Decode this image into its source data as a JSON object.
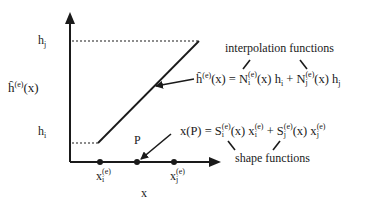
{
  "diagram": {
    "y_axis_label": "ĥ",
    "y_axis_label_sup": "(e)",
    "y_axis_label_arg": "(x)",
    "x_axis_label": "x",
    "hj_label": "h",
    "hj_sub": "j",
    "hi_label": "h",
    "hi_sub": "i",
    "point_label": "P",
    "xi_label": "x",
    "xi_sup": "(e)",
    "xi_sub": "i",
    "xj_label": "x",
    "xj_sup": "(e)",
    "xj_sub": "j",
    "interp_caption": "interpolation functions",
    "shape_caption": "shape functions",
    "eq1": {
      "lhs": "ĥ",
      "lhs_sup": "(e)",
      "lhs_arg": "(x) = N",
      "n1_sup": "(e)",
      "n1_sub": "i",
      "n1_tail": "(x) h",
      "h1_sub": "i",
      "plus": " +  N",
      "n2_sup": "(e)",
      "n2_sub": "j",
      "n2_tail": "(x) h",
      "h2_sub": "j"
    },
    "eq2": {
      "lhs": "x(P) = S",
      "s1_sup": "(e)",
      "s1_sub": "i",
      "s1_tail": "(x) x",
      "x1_sup": "(e)",
      "x1_sub": "i",
      "plus": " + S",
      "s2_sup": "(e)",
      "s2_sub": "j",
      "s2_tail": "(x) x",
      "x2_sup": "(e)",
      "x2_sub": "j"
    },
    "colors": {
      "ink": "#1a1a1a",
      "background": "#ffffff"
    }
  }
}
